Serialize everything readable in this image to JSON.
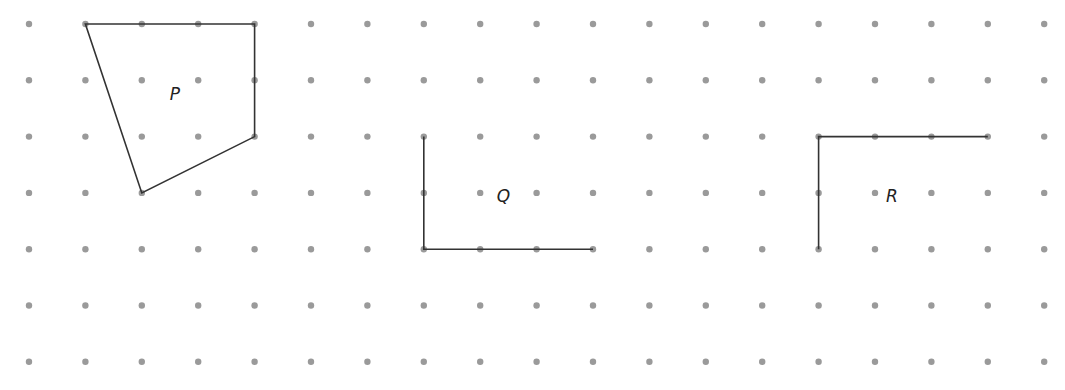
{
  "grid": {
    "cols": 19,
    "rows": 7,
    "origin_x": 29,
    "origin_y": 24,
    "spacing_x": 56.4,
    "spacing_y": 56.3,
    "dot_radius": 3.2,
    "dot_color": "#9a9a9a"
  },
  "line_color": "#333333",
  "shapes": [
    {
      "name": "P",
      "label": "P",
      "closed": true,
      "points": [
        [
          1,
          0
        ],
        [
          4,
          0
        ],
        [
          4,
          2
        ],
        [
          2,
          3
        ]
      ],
      "label_pos": [
        2.6,
        1.25
      ]
    },
    {
      "name": "Q",
      "label": "Q",
      "closed": false,
      "points": [
        [
          7,
          2
        ],
        [
          7,
          4
        ],
        [
          10,
          4
        ]
      ],
      "label_pos": [
        8.4,
        3.05
      ]
    },
    {
      "name": "R",
      "label": "R",
      "closed": false,
      "points": [
        [
          14,
          4
        ],
        [
          14,
          2
        ],
        [
          17,
          2
        ]
      ],
      "label_pos": [
        15.3,
        3.05
      ]
    }
  ]
}
